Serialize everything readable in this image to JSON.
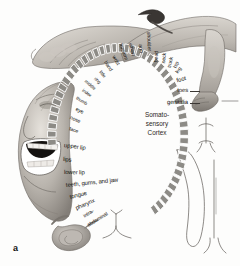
{
  "figure": {
    "letter": "a",
    "caption_lines": [
      "Somato-",
      "sensory",
      "Cortex"
    ],
    "band_color": "#8d8b86",
    "band_edge_color": "#ffffff",
    "label_color": "#16130f",
    "background": "#fdfdfc"
  },
  "center": {
    "line1": "Somato-",
    "line2": "sensory",
    "line3": "Cortex"
  },
  "labels": [
    {
      "text": "toes",
      "size": "lg",
      "x": 188,
      "y": 91,
      "rot": 0,
      "anchor": "end",
      "leader": true
    },
    {
      "text": "genitalia",
      "size": "lg",
      "x": 188,
      "y": 103,
      "rot": 0,
      "anchor": "end",
      "leader": true
    },
    {
      "text": "foot",
      "size": "lg",
      "x": 186,
      "y": 79,
      "rot": -14,
      "anchor": "end",
      "leader": false
    },
    {
      "text": "leg",
      "size": "md",
      "x": 181,
      "y": 68,
      "rot": -52,
      "anchor": "end",
      "leader": false
    },
    {
      "text": "hip",
      "size": "md",
      "x": 178,
      "y": 62,
      "rot": -66,
      "anchor": "end",
      "leader": false
    },
    {
      "text": "trunk",
      "size": "md",
      "x": 172,
      "y": 57,
      "rot": -78,
      "anchor": "end",
      "leader": false
    },
    {
      "text": "neck",
      "size": "md",
      "x": 165,
      "y": 53,
      "rot": -84,
      "anchor": "end",
      "leader": false
    },
    {
      "text": "head",
      "size": "md",
      "x": 157,
      "y": 51,
      "rot": -88,
      "anchor": "end",
      "leader": false
    },
    {
      "text": "shoulder",
      "size": "md",
      "x": 149,
      "y": 51,
      "rot": -93,
      "anchor": "end",
      "leader": false
    },
    {
      "text": "arm",
      "size": "md",
      "x": 141,
      "y": 53,
      "rot": -99,
      "anchor": "end",
      "leader": false
    },
    {
      "text": "elbow",
      "size": "md",
      "x": 133,
      "y": 56,
      "rot": -105,
      "anchor": "end",
      "leader": false
    },
    {
      "text": "forearm",
      "size": "md",
      "x": 126,
      "y": 60,
      "rot": -111,
      "anchor": "end",
      "leader": false
    },
    {
      "text": "wrist",
      "size": "md",
      "x": 118,
      "y": 65,
      "rot": -118,
      "anchor": "end",
      "leader": false
    },
    {
      "text": "hand",
      "size": "md",
      "x": 111,
      "y": 71,
      "rot": -124,
      "anchor": "end",
      "leader": false
    },
    {
      "text": "little",
      "size": "sm",
      "x": 105,
      "y": 77,
      "rot": -130,
      "anchor": "end",
      "leader": false
    },
    {
      "text": "ring",
      "size": "sm",
      "x": 100,
      "y": 83,
      "rot": -135,
      "anchor": "end",
      "leader": false
    },
    {
      "text": "middle",
      "size": "sm",
      "x": 95,
      "y": 89,
      "rot": -139,
      "anchor": "end",
      "leader": false
    },
    {
      "text": "index",
      "size": "sm",
      "x": 91,
      "y": 96,
      "rot": -143,
      "anchor": "end",
      "leader": false
    },
    {
      "text": "thumb",
      "size": "sm",
      "x": 87,
      "y": 104,
      "rot": -148,
      "anchor": "end",
      "leader": false
    },
    {
      "text": "eye",
      "size": "md",
      "x": 83,
      "y": 113,
      "rot": -153,
      "anchor": "end",
      "leader": false
    },
    {
      "text": "nose",
      "size": "md",
      "x": 80,
      "y": 122,
      "rot": -158,
      "anchor": "end",
      "leader": false
    },
    {
      "text": "face",
      "size": "md",
      "x": 78,
      "y": 132,
      "rot": -163,
      "anchor": "end",
      "leader": false
    },
    {
      "text": "upper lip",
      "size": "lg",
      "x": 64,
      "y": 146,
      "rot": -172,
      "anchor": "start",
      "leader": false
    },
    {
      "text": "lips",
      "size": "lg",
      "x": 63,
      "y": 160,
      "rot": -176,
      "anchor": "start",
      "leader": false
    },
    {
      "text": "lower lip",
      "size": "lg",
      "x": 64,
      "y": 173,
      "rot": -179,
      "anchor": "start",
      "leader": false
    },
    {
      "text": "teeth, gums, and jaw",
      "size": "lg",
      "x": 66,
      "y": 186,
      "rot": -186,
      "anchor": "start",
      "leader": false
    },
    {
      "text": "tongue",
      "size": "lg",
      "x": 70,
      "y": 198,
      "rot": -194,
      "anchor": "start",
      "leader": false
    },
    {
      "text": "pharynx",
      "size": "lg",
      "x": 76,
      "y": 209,
      "rot": -203,
      "anchor": "start",
      "leader": false
    },
    {
      "text": "intra-",
      "size": "md",
      "x": 84,
      "y": 217,
      "rot": -212,
      "anchor": "start",
      "leader": false
    },
    {
      "text": "abdominal",
      "size": "md",
      "x": 88,
      "y": 226,
      "rot": -212,
      "anchor": "start",
      "leader": false
    }
  ]
}
